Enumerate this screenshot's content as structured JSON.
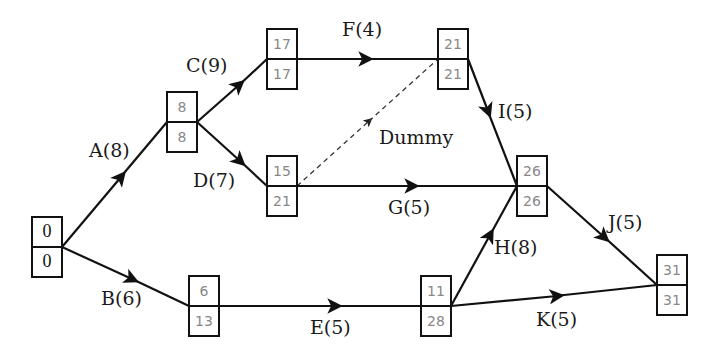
{
  "diagram": {
    "type": "activity-on-arrow network (critical path analysis)",
    "nodes": [
      {
        "id": "n0",
        "early": "0",
        "late": "0"
      },
      {
        "id": "n1",
        "early": "8",
        "late": "8"
      },
      {
        "id": "n2",
        "early": "17",
        "late": "17"
      },
      {
        "id": "n3",
        "early": "15",
        "late": "21"
      },
      {
        "id": "n4",
        "early": "21",
        "late": "21"
      },
      {
        "id": "n5",
        "early": "6",
        "late": "13"
      },
      {
        "id": "n6",
        "early": "26",
        "late": "26"
      },
      {
        "id": "n7",
        "early": "11",
        "late": "28"
      },
      {
        "id": "n8",
        "early": "31",
        "late": "31"
      }
    ],
    "activities": [
      {
        "label": "A(8)",
        "from": "n0",
        "to": "n1"
      },
      {
        "label": "B(6)",
        "from": "n0",
        "to": "n5"
      },
      {
        "label": "C(9)",
        "from": "n1",
        "to": "n2"
      },
      {
        "label": "D(7)",
        "from": "n1",
        "to": "n3"
      },
      {
        "label": "F(4)",
        "from": "n2",
        "to": "n4"
      },
      {
        "label": "Dummy",
        "from": "n3",
        "to": "n4"
      },
      {
        "label": "G(5)",
        "from": "n3",
        "to": "n6"
      },
      {
        "label": "I(5)",
        "from": "n4",
        "to": "n6"
      },
      {
        "label": "E(5)",
        "from": "n5",
        "to": "n7"
      },
      {
        "label": "H(8)",
        "from": "n7",
        "to": "n6"
      },
      {
        "label": "J(5)",
        "from": "n6",
        "to": "n8"
      },
      {
        "label": "K(5)",
        "from": "n7",
        "to": "n8"
      }
    ]
  }
}
